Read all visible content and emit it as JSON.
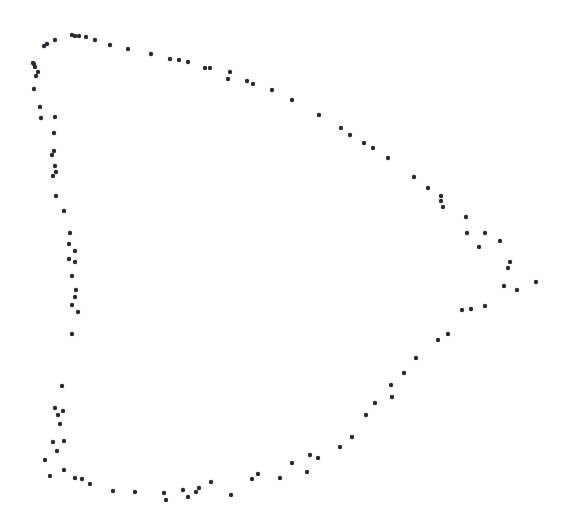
{
  "figure": {
    "title": "",
    "background_color": "#ffffff",
    "width": 567,
    "height": 521
  },
  "chart_data": {
    "type": "scatter",
    "title": "",
    "subtitle": "",
    "xlabel": "",
    "ylabel": "",
    "xlim": [
      0,
      567
    ],
    "ylim": [
      0,
      521
    ],
    "grid": false,
    "legend": null,
    "axes_visible": false,
    "tick_labels_x": [],
    "tick_labels_y": [],
    "annotations": [],
    "marker": {
      "shape": "circle",
      "color": "#2a2a33",
      "size_px": 3.2
    },
    "series": [
      {
        "name": "outline",
        "color": "#2a2a33",
        "n_points": 112,
        "points": [
          [
            55,
            40
          ],
          [
            47,
            44
          ],
          [
            44,
            46
          ],
          [
            72,
            35
          ],
          [
            75,
            36
          ],
          [
            79,
            36
          ],
          [
            86,
            37
          ],
          [
            95,
            40
          ],
          [
            110,
            45
          ],
          [
            128,
            49
          ],
          [
            151,
            54
          ],
          [
            170,
            59
          ],
          [
            179,
            60
          ],
          [
            188,
            62
          ],
          [
            205,
            68
          ],
          [
            210,
            68
          ],
          [
            228,
            79
          ],
          [
            247,
            81
          ],
          [
            272,
            90
          ],
          [
            292,
            100
          ],
          [
            319,
            115
          ],
          [
            341,
            128
          ],
          [
            364,
            143
          ],
          [
            388,
            158
          ],
          [
            414,
            177
          ],
          [
            441,
            196
          ],
          [
            441,
            201
          ],
          [
            466,
            217
          ],
          [
            467,
            233
          ],
          [
            479,
            247
          ],
          [
            485,
            233
          ],
          [
            500,
            241
          ],
          [
            510,
            262
          ],
          [
            517,
            290
          ],
          [
            536,
            282
          ],
          [
            462,
            310
          ],
          [
            471,
            309
          ],
          [
            485,
            306
          ],
          [
            448,
            334
          ],
          [
            416,
            358
          ],
          [
            391,
            385
          ],
          [
            392,
            397
          ],
          [
            366,
            415
          ],
          [
            352,
            437
          ],
          [
            310,
            455
          ],
          [
            318,
            458
          ],
          [
            307,
            472
          ],
          [
            280,
            478
          ],
          [
            258,
            474
          ],
          [
            231,
            495
          ],
          [
            199,
            488
          ],
          [
            196,
            492
          ],
          [
            183,
            490
          ],
          [
            164,
            493
          ],
          [
            211,
            482
          ],
          [
            166,
            500
          ],
          [
            113,
            491
          ],
          [
            82,
            479
          ],
          [
            75,
            478
          ],
          [
            64,
            470
          ],
          [
            50,
            476
          ],
          [
            57,
            451
          ],
          [
            53,
            442
          ],
          [
            64,
            441
          ],
          [
            58,
            415
          ],
          [
            55,
            408
          ],
          [
            63,
            411
          ],
          [
            62,
            386
          ],
          [
            72,
            334
          ],
          [
            78,
            312
          ],
          [
            72,
            305
          ],
          [
            75,
            297
          ],
          [
            76,
            290
          ],
          [
            72,
            276
          ],
          [
            75,
            262
          ],
          [
            69,
            259
          ],
          [
            75,
            251
          ],
          [
            69,
            244
          ],
          [
            70,
            233
          ],
          [
            64,
            211
          ],
          [
            56,
            196
          ],
          [
            53,
            176
          ],
          [
            56,
            172
          ],
          [
            55,
            166
          ],
          [
            52,
            155
          ],
          [
            54,
            151
          ],
          [
            54,
            133
          ],
          [
            55,
            117
          ],
          [
            41,
            118
          ],
          [
            40,
            107
          ],
          [
            34,
            89
          ],
          [
            36,
            76
          ],
          [
            38,
            72
          ],
          [
            35,
            67
          ],
          [
            34,
            64
          ],
          [
            33,
            63
          ],
          [
            230,
            72
          ],
          [
            253,
            84
          ],
          [
            350,
            135
          ],
          [
            373,
            148
          ],
          [
            428,
            188
          ],
          [
            443,
            207
          ],
          [
            508,
            268
          ],
          [
            504,
            286
          ],
          [
            438,
            340
          ],
          [
            404,
            373
          ],
          [
            375,
            403
          ],
          [
            340,
            447
          ],
          [
            292,
            463
          ],
          [
            252,
            479
          ],
          [
            188,
            497
          ],
          [
            135,
            492
          ],
          [
            90,
            484
          ],
          [
            45,
            460
          ],
          [
            60,
            424
          ]
        ]
      }
    ]
  }
}
